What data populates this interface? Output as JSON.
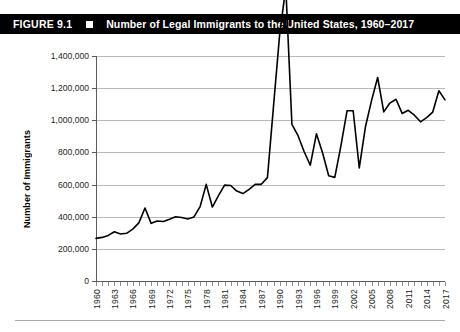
{
  "figure": {
    "number": "FIGURE 9.1",
    "marker_icon": "filled-square-icon",
    "title": "Number of Legal Immigrants to the United States, 1960–2017"
  },
  "colors": {
    "banner_background": "#000000",
    "banner_text": "#ffffff",
    "line": "#000000",
    "gridline": "#b9b9b9",
    "axis": "#58595b",
    "tick_text": "#231f20"
  },
  "chart_data": {
    "type": "line",
    "title": "Number of Legal Immigrants to the United States, 1960–2017",
    "xlabel": "",
    "ylabel": "Number of Immigrants",
    "ylim": [
      0,
      1400000
    ],
    "xlim": [
      1960,
      2017
    ],
    "grid": true,
    "legend": "none",
    "ytick_labels": [
      "1,400,000",
      "1,200,000",
      "1,000,000",
      "800,000",
      "600,000",
      "400,000",
      "200,000",
      "0"
    ],
    "ytick_values": [
      1400000,
      1200000,
      1000000,
      800000,
      600000,
      400000,
      200000,
      0
    ],
    "xtick_labels": [
      "1960",
      "1963",
      "1966",
      "1969",
      "1972",
      "1975",
      "1978",
      "1981",
      "1984",
      "1987",
      "1990",
      "1993",
      "1996",
      "1999",
      "2002",
      "2005",
      "2008",
      "2011",
      "2014",
      "2017"
    ],
    "xtick_values": [
      1960,
      1963,
      1966,
      1969,
      1972,
      1975,
      1978,
      1981,
      1984,
      1987,
      1990,
      1993,
      1996,
      1999,
      2002,
      2005,
      2008,
      2011,
      2014,
      2017
    ],
    "x": [
      1960,
      1961,
      1962,
      1963,
      1964,
      1965,
      1966,
      1967,
      1968,
      1969,
      1970,
      1971,
      1972,
      1973,
      1974,
      1975,
      1976,
      1977,
      1978,
      1979,
      1980,
      1981,
      1982,
      1983,
      1984,
      1985,
      1986,
      1987,
      1988,
      1989,
      1990,
      1991,
      1992,
      1993,
      1994,
      1995,
      1996,
      1997,
      1998,
      1999,
      2000,
      2001,
      2002,
      2003,
      2004,
      2005,
      2006,
      2007,
      2008,
      2009,
      2010,
      2011,
      2012,
      2013,
      2014,
      2015,
      2016,
      2017
    ],
    "values": [
      265398,
      271344,
      283763,
      306260,
      292248,
      296697,
      323040,
      361972,
      454448,
      358579,
      373326,
      370478,
      384685,
      400063,
      394861,
      386194,
      398613,
      462315,
      601442,
      460348,
      530639,
      596600,
      594131,
      559763,
      543903,
      570009,
      601708,
      601516,
      643025,
      1090924,
      1536483,
      1827167,
      973977,
      904292,
      804416,
      720461,
      915900,
      798378,
      654451,
      644787,
      841002,
      1058902,
      1059356,
      703542,
      957883,
      1122257,
      1266129,
      1052415,
      1107126,
      1130818,
      1042625,
      1062040,
      1031631,
      990553,
      1016518,
      1051031,
      1183505,
      1127167
    ],
    "series": [
      {
        "name": "Legal immigrants admitted",
        "values": [
          265398,
          271344,
          283763,
          306260,
          292248,
          296697,
          323040,
          361972,
          454448,
          358579,
          373326,
          370478,
          384685,
          400063,
          394861,
          386194,
          398613,
          462315,
          601442,
          460348,
          530639,
          596600,
          594131,
          559763,
          543903,
          570009,
          601708,
          601516,
          643025,
          1090924,
          1536483,
          1827167,
          973977,
          904292,
          804416,
          720461,
          915900,
          798378,
          654451,
          644787,
          841002,
          1058902,
          1059356,
          703542,
          957883,
          1122257,
          1266129,
          1052415,
          1107126,
          1130818,
          1042625,
          1062040,
          1031631,
          990553,
          1016518,
          1051031,
          1183505,
          1127167
        ]
      }
    ]
  }
}
